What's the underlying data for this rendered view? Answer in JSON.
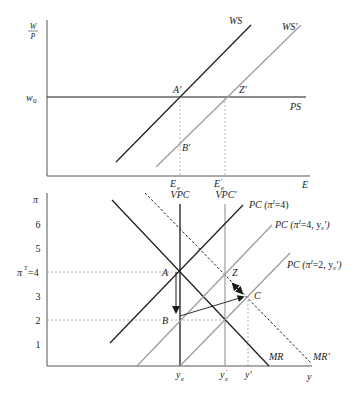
{
  "top_panel": {
    "y_axis_label_num": "W",
    "y_axis_label_den": "P",
    "x_axis_label": "E",
    "w0_label": "w",
    "w0_sub": "0",
    "curves": {
      "ws": "WS",
      "ws_prime": "WS′",
      "ps": "PS"
    },
    "points": {
      "a_prime": "A′",
      "b_prime": "B′",
      "z_prime": "Z′"
    },
    "x_ticks": {
      "ee": "E",
      "ee_sub": "e",
      "ee_prime": "E",
      "ee_prime_sub": "e",
      "ee_prime_mark": "′"
    }
  },
  "bottom_panel": {
    "y_axis_label": "π",
    "x_axis_label": "y",
    "y_ticks": [
      "6",
      "5",
      "4",
      "3",
      "2",
      "1"
    ],
    "pi_target_label": "π",
    "pi_target_sup": "T",
    "pi_target_eq": "=4",
    "vpc": "VPC",
    "vpc_prime": "VPC′",
    "curves": {
      "pc1": "PC (π",
      "pc1_rest": "=4)",
      "pc2": "PC (π",
      "pc2_rest": "=4, y",
      "pc2_end": "′)",
      "pc3": "PC (π",
      "pc3_rest": "=2, y",
      "pc3_end": "′)",
      "sup_i": "I",
      "sub_e": "e",
      "mr": "MR",
      "mr_prime": "MR′"
    },
    "points": {
      "a": "A",
      "b": "B",
      "z": "Z",
      "c": "C"
    },
    "x_ticks": {
      "ye": "y",
      "ye_sub": "e",
      "ye_prime": "y",
      "ye_prime_sub": "e",
      "ye_prime_mark": "′",
      "y_prime": "y′"
    }
  },
  "colors": {
    "black_line": "#1a1a1a",
    "grey_line": "#9a9a9a",
    "dashed_guide": "#a0a0a0"
  }
}
